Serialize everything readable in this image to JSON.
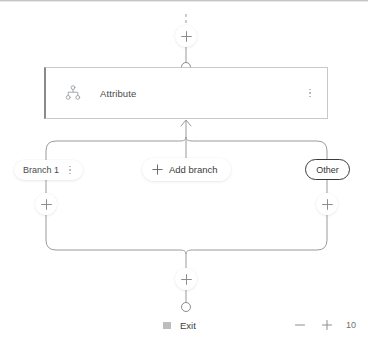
{
  "canvas": {
    "node": {
      "icon": "hierarchy-icon",
      "label": "Attribute",
      "menu_icon": "more-options-icon"
    },
    "top_connector": {
      "add_icon": "plus-icon",
      "endpoint_icon": "circle-connector-icon"
    },
    "branches": [
      {
        "label": "Branch 1",
        "menu_icon": "more-options-icon",
        "add_icon": "plus-icon"
      },
      {
        "label": "Other",
        "add_icon": "plus-icon"
      }
    ],
    "add_branch": {
      "label": "Add branch",
      "icon": "plus-icon"
    },
    "merge": {
      "add_icon": "plus-icon",
      "endpoint_icon": "circle-connector-icon"
    },
    "exit": {
      "icon": "stop-square-icon",
      "label": "Exit"
    }
  },
  "zoom_control": {
    "zoom_out_icon": "minus-icon",
    "zoom_in_icon": "plus-icon",
    "level": "10"
  },
  "colors": {
    "wire": "#9a9a9a",
    "card_border": "#c8c8c8",
    "card_accent": "#8a8a8a",
    "text": "#4a4a4a",
    "muted": "#9aa0a6",
    "other_border": "#3a3a3a"
  }
}
